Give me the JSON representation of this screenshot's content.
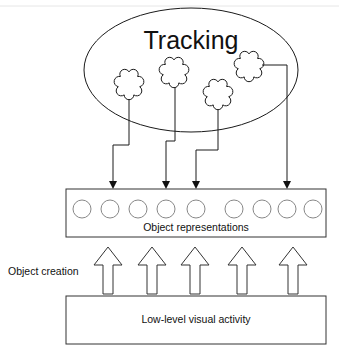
{
  "diagram": {
    "title": "Tracking",
    "object_representations_label": "Object representations",
    "object_creation_label": "Object creation",
    "low_level_label": "Low-level visual activity",
    "tracked_objects_count": 4,
    "object_slots_count": 9,
    "creation_arrows_count": 5
  }
}
